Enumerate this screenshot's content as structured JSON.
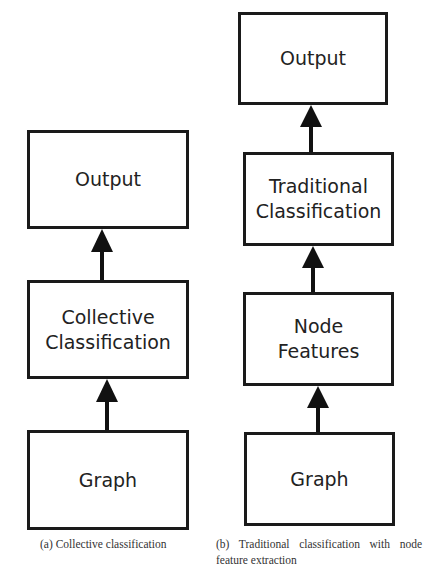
{
  "diagram_a": {
    "nodes": [
      {
        "id": "output",
        "label": "Output"
      },
      {
        "id": "collective",
        "label": "Collective\nClassification"
      },
      {
        "id": "graph",
        "label": "Graph"
      }
    ],
    "edges": [
      {
        "from": "graph",
        "to": "collective"
      },
      {
        "from": "collective",
        "to": "output"
      }
    ],
    "caption": "(a) Collective classification"
  },
  "diagram_b": {
    "nodes": [
      {
        "id": "output",
        "label": "Output"
      },
      {
        "id": "traditional",
        "label": "Traditional\nClassification"
      },
      {
        "id": "node_features",
        "label": "Node\nFeatures"
      },
      {
        "id": "graph",
        "label": "Graph"
      }
    ],
    "edges": [
      {
        "from": "graph",
        "to": "node_features"
      },
      {
        "from": "node_features",
        "to": "traditional"
      },
      {
        "from": "traditional",
        "to": "output"
      }
    ],
    "caption": "(b) Traditional classification with node feature extraction"
  }
}
